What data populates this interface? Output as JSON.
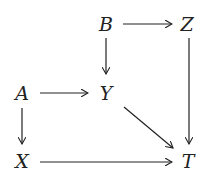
{
  "diagram": {
    "nodes": [
      {
        "id": "B",
        "label": "B",
        "x": 106,
        "y": 24
      },
      {
        "id": "Z",
        "label": "Z",
        "x": 187,
        "y": 24
      },
      {
        "id": "A",
        "label": "A",
        "x": 22,
        "y": 93
      },
      {
        "id": "Y",
        "label": "Y",
        "x": 106,
        "y": 93
      },
      {
        "id": "X",
        "label": "X",
        "x": 22,
        "y": 161
      },
      {
        "id": "T",
        "label": "T",
        "x": 188,
        "y": 161
      }
    ],
    "edges": [
      {
        "from": "B",
        "to": "Z"
      },
      {
        "from": "B",
        "to": "Y"
      },
      {
        "from": "A",
        "to": "Y"
      },
      {
        "from": "A",
        "to": "X"
      },
      {
        "from": "Y",
        "to": "T"
      },
      {
        "from": "Z",
        "to": "T"
      },
      {
        "from": "X",
        "to": "T"
      }
    ]
  }
}
